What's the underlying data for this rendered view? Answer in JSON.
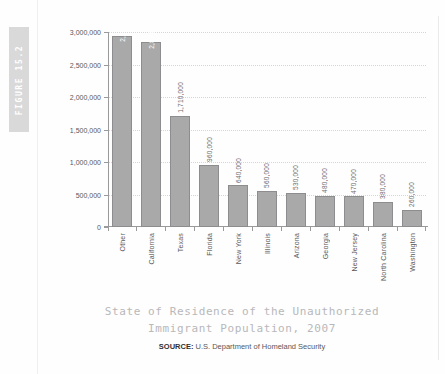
{
  "figure": {
    "tab_label": "FIGURE 15.2"
  },
  "caption": {
    "title_line_1": "State of Residence of the Unauthorized",
    "title_line_2": "Immigrant Population, 2007",
    "source_label": "SOURCE:",
    "source_text": "U.S. Department of Homeland Security"
  },
  "colors": {
    "bar_fill": "#a9a9a9",
    "bar_stroke": "#8d8d8f",
    "axis": "#9a9a9a",
    "gridline": "#d6d6d6",
    "tab_background": "#d9d9d9",
    "title_text": "#b8b8ba",
    "tick_text": "#58585a",
    "inside_label_text": "#ffffff",
    "above_label_text": "#6d6d6f"
  },
  "chart_data": {
    "type": "bar",
    "title": "State of Residence of the Unauthorized Immigrant Population, 2007",
    "xlabel": "",
    "ylabel": "",
    "ylim": [
      0,
      3000000
    ],
    "ytick_step": 500000,
    "ytick_labels": [
      "0",
      "500,000",
      "1,000,000",
      "1,500,000",
      "2,000,000",
      "2,500,000",
      "3,000,000"
    ],
    "ytick_values": [
      0,
      500000,
      1000000,
      1500000,
      2000000,
      2500000,
      3000000
    ],
    "grid": true,
    "grid_style": "dotted-horizontal",
    "legend": false,
    "orientation": "vertical",
    "categories": [
      "Other",
      "California",
      "Texas",
      "Florida",
      "New York",
      "Illinois",
      "Arizona",
      "Georgia",
      "New Jersey",
      "North Carolina",
      "Washington"
    ],
    "values": [
      2940000,
      2840000,
      1710000,
      960000,
      640000,
      560000,
      530000,
      480000,
      470000,
      380000,
      260000
    ],
    "value_labels": [
      "2,940,000",
      "2,840,000",
      "1,710,000",
      "960,000",
      "640,000",
      "560,000",
      "530,000",
      "480,000",
      "470,000",
      "380,000",
      "260,000"
    ],
    "label_placement": [
      "inside",
      "inside",
      "above",
      "above",
      "above",
      "above",
      "above",
      "above",
      "above",
      "above",
      "above"
    ],
    "label_rotation_deg": 90,
    "source": "U.S. Department of Homeland Security"
  }
}
